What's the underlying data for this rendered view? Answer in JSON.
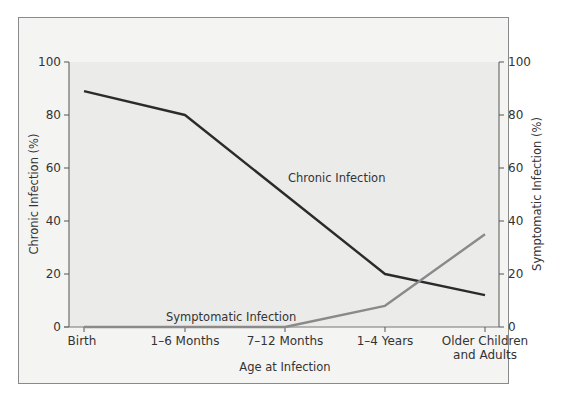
{
  "chart_data": {
    "type": "line",
    "title": "",
    "xlabel": "Age at Infection",
    "ylabel": "Chronic Infection (%)",
    "y2label": "Symptomatic Infection (%)",
    "categories": [
      "Birth",
      "1–6 Months",
      "7–12 Months",
      "1–4 Years",
      "Older Children and Adults"
    ],
    "category_lines": [
      [
        "Birth"
      ],
      [
        "1–6 Months"
      ],
      [
        "7–12 Months"
      ],
      [
        "1–4 Years"
      ],
      [
        "Older Children",
        "and Adults"
      ]
    ],
    "series": [
      {
        "name": "Chronic Infection",
        "axis": "left",
        "color": "#2b2b2b",
        "values": [
          89,
          80,
          50,
          20,
          12
        ]
      },
      {
        "name": "Symptomatic Infection",
        "axis": "right",
        "color": "#8a8a8a",
        "values": [
          0,
          0,
          0,
          8,
          35
        ]
      }
    ],
    "ylim": [
      0,
      100
    ],
    "y2lim": [
      0,
      100
    ],
    "yticks": [
      0,
      20,
      40,
      60,
      80,
      100
    ],
    "y2ticks": [
      0,
      20,
      40,
      60,
      80,
      100
    ],
    "grid": false,
    "legend": "inline labels",
    "annotations": [
      {
        "text": "Chronic Infection",
        "near": "7–12 Months to 1–4 Years, chronic line"
      },
      {
        "text": "Symptomatic Infection",
        "near": "above baseline around 1–6 to 7–12 Months"
      }
    ]
  },
  "labels": {
    "chronic": "Chronic Infection",
    "symptomatic": "Symptomatic Infection"
  }
}
